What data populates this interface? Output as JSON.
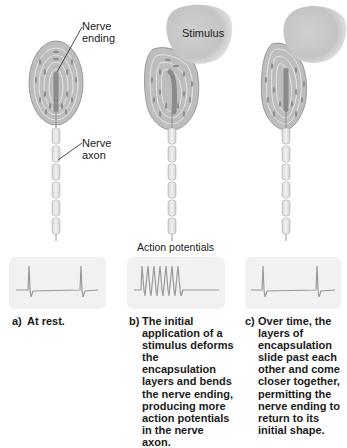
{
  "labels": {
    "nerve_ending": [
      "Nerve",
      "ending"
    ],
    "nerve_axon": [
      "Nerve",
      "axon"
    ],
    "stimulus": "Stimulus",
    "action_potentials": "Action potentials"
  },
  "panels": [
    {
      "tag": "a)",
      "caption": "At rest.",
      "action_potential_spikes": 2,
      "state": "rest"
    },
    {
      "tag": "b)",
      "caption": "The initial application of a stimulus deforms the encapsulation layers and bends the nerve ending, producing more action potentials in the nerve axon.",
      "action_potential_spikes": 7,
      "state": "initial-stimulus"
    },
    {
      "tag": "c)",
      "caption": "Over time, the layers of encapsulation slide past each other and come closer together, permitting the nerve ending to return to its initial shape.",
      "action_potential_spikes": 2,
      "state": "sustained-stimulus"
    }
  ],
  "colors": {
    "capsule_fill": "#b8b8b8",
    "capsule_line": "#888888",
    "stimulus_fill": "#c8c8c8",
    "trace": "#9a9a9a",
    "ap_box": "#f1f1f1"
  }
}
